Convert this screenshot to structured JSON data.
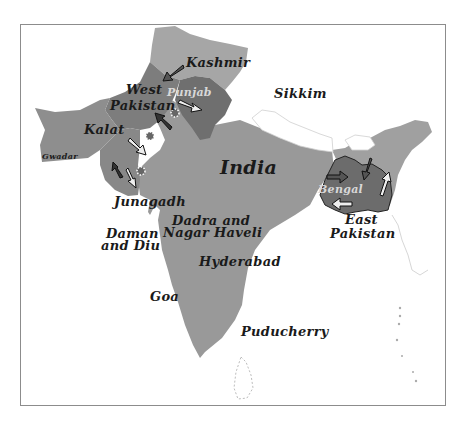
{
  "map": {
    "colors": {
      "background": "#ffffff",
      "frame": "#8c8c8c",
      "india": "#999999",
      "kashmir": "#a6a6a6",
      "west_pakistan": "#7d7d7d",
      "punjab": "#6f6f6f",
      "kalat": "#8e8e8e",
      "bengal": "#6c6c6c",
      "northeast": "#a0a0a0",
      "nepal_bhutan": "#ffffff",
      "label": "#1a1a1a",
      "label_light": "#d8d8d8"
    },
    "labels": {
      "kashmir": "Kashmir",
      "west_pakistan_line1": "West",
      "west_pakistan_line2": "Pakistan",
      "punjab": "Punjab",
      "sikkim": "Sikkim",
      "kalat": "Kalat",
      "gwadar": "Gwadar",
      "india": "India",
      "junagadh": "Junagadh",
      "dadra_line1": "Dadra and",
      "dadra_line2": "Nagar Haveli",
      "daman_line1": "Daman",
      "daman_line2": "and Diu",
      "hyderabad": "Hyderabad",
      "goa": "Goa",
      "puducherry": "Puducherry",
      "bengal": "Bengal",
      "east_pakistan_line1": "East",
      "east_pakistan_line2": "Pakistan"
    },
    "markers": {
      "migration_arrows": "arrow-icon",
      "conflict_bursts": "burst-icon"
    }
  }
}
